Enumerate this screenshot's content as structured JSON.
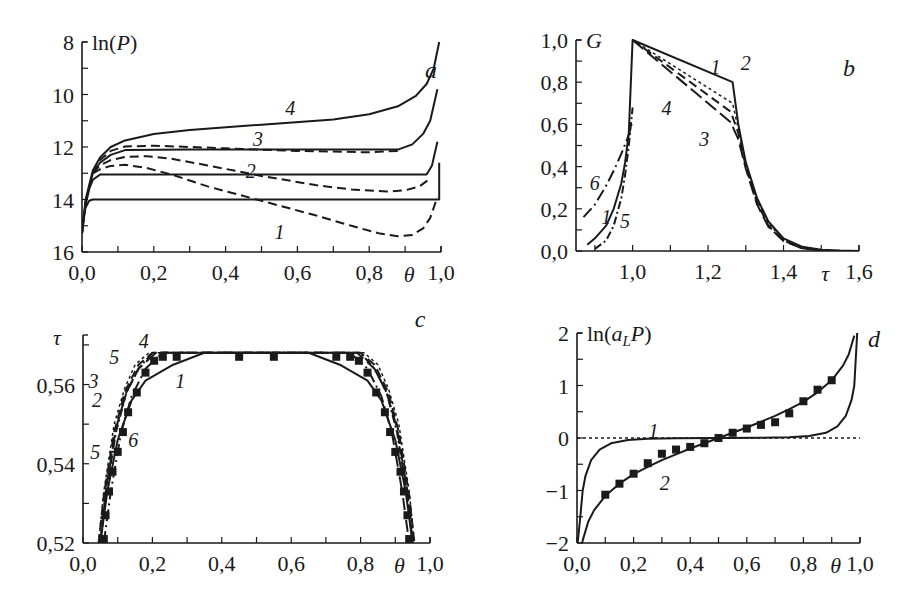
{
  "figure": {
    "panels": [
      "a",
      "b",
      "c",
      "d"
    ]
  },
  "chart_data": [
    {
      "id": "a",
      "type": "line",
      "panel_letter": "a",
      "ylabel": "ln(P)",
      "xlabel": "θ",
      "xlim": [
        0.0,
        1.0
      ],
      "ylim": [
        16,
        8
      ],
      "y_inverted": true,
      "xticks": [
        "0,0",
        "0,2",
        "0,4",
        "0,6",
        "0,8",
        "1,0"
      ],
      "xtick_values": [
        0.0,
        0.2,
        0.4,
        0.6,
        0.8,
        1.0
      ],
      "yticks": [
        "8",
        "10",
        "12",
        "14",
        "16"
      ],
      "ytick_values": [
        8,
        10,
        12,
        14,
        16
      ],
      "frame": {
        "x0": 82,
        "x1": 441,
        "y0": 42,
        "y1": 252
      },
      "series": [
        {
          "name": "flat-14",
          "style": "solid",
          "x": [
            0.0,
            0.005,
            0.01,
            0.02,
            0.03,
            0.99,
            0.995,
            0.995
          ],
          "y": [
            15.3,
            14.6,
            14.3,
            14.05,
            14.0,
            14.0,
            14.0,
            12.6
          ]
        },
        {
          "name": "flat-13",
          "style": "solid",
          "x": [
            0.0,
            0.01,
            0.02,
            0.03,
            0.05,
            0.96,
            0.975,
            0.99
          ],
          "y": [
            15.3,
            14.2,
            13.6,
            13.25,
            13.05,
            13.05,
            12.7,
            11.8
          ]
        },
        {
          "name": "3",
          "style": "solid",
          "x": [
            0.0,
            0.01,
            0.03,
            0.05,
            0.08,
            0.12,
            0.3,
            0.6,
            0.88,
            0.92,
            0.95,
            0.97,
            0.99
          ],
          "y": [
            15.3,
            14.1,
            13.0,
            12.6,
            12.3,
            12.12,
            12.1,
            12.1,
            12.1,
            11.9,
            11.5,
            11.0,
            9.8
          ]
        },
        {
          "name": "4",
          "style": "solid",
          "x": [
            0.0,
            0.01,
            0.03,
            0.05,
            0.08,
            0.12,
            0.2,
            0.3,
            0.5,
            0.7,
            0.8,
            0.88,
            0.93,
            0.96,
            0.98,
            0.995
          ],
          "y": [
            15.3,
            14.0,
            12.9,
            12.4,
            12.0,
            11.75,
            11.5,
            11.35,
            11.15,
            10.95,
            10.75,
            10.45,
            10.05,
            9.6,
            9.0,
            8.0
          ]
        },
        {
          "name": "3-dashed",
          "style": "dashed",
          "x": [
            0.03,
            0.05,
            0.08,
            0.12,
            0.2,
            0.4,
            0.6,
            0.8,
            0.88
          ],
          "y": [
            13.0,
            12.5,
            12.15,
            11.98,
            11.95,
            12.05,
            12.15,
            12.2,
            12.15
          ]
        },
        {
          "name": "2",
          "style": "dashed",
          "x": [
            0.03,
            0.05,
            0.08,
            0.12,
            0.18,
            0.25,
            0.35,
            0.5,
            0.65,
            0.75,
            0.85,
            0.9,
            0.94,
            0.97
          ],
          "y": [
            13.0,
            12.7,
            12.5,
            12.38,
            12.35,
            12.45,
            12.7,
            13.1,
            13.45,
            13.62,
            13.7,
            13.65,
            13.5,
            13.2
          ]
        },
        {
          "name": "1",
          "style": "dashed",
          "x": [
            0.03,
            0.05,
            0.08,
            0.12,
            0.18,
            0.25,
            0.35,
            0.5,
            0.65,
            0.75,
            0.83,
            0.88,
            0.92,
            0.95,
            0.97,
            0.99
          ],
          "y": [
            13.0,
            12.85,
            12.72,
            12.68,
            12.8,
            13.05,
            13.5,
            14.05,
            14.6,
            15.0,
            15.3,
            15.4,
            15.35,
            15.1,
            14.7,
            13.9
          ]
        }
      ],
      "annotations": [
        {
          "text": "4",
          "x": 0.58,
          "y": 10.5
        },
        {
          "text": "3",
          "x": 0.49,
          "y": 11.7
        },
        {
          "text": "2",
          "x": 0.47,
          "y": 12.9
        },
        {
          "text": "1",
          "x": 0.55,
          "y": 15.25
        }
      ]
    },
    {
      "id": "b",
      "type": "line",
      "panel_letter": "b",
      "ylabel": "G",
      "xlabel": "τ",
      "xlim": [
        0.85,
        1.6
      ],
      "ylim": [
        0.0,
        1.0
      ],
      "xticks": [
        "1,0",
        "1,2",
        "1,4",
        "1,6"
      ],
      "xtick_values": [
        1.0,
        1.2,
        1.4,
        1.6
      ],
      "yticks": [
        "0,0",
        "0,2",
        "0,4",
        "0,6",
        "0,8",
        "1,0"
      ],
      "ytick_values": [
        0.0,
        0.2,
        0.4,
        0.6,
        0.8,
        1.0
      ],
      "frame": {
        "x0": 576,
        "x1": 859,
        "y0": 40,
        "y1": 251
      },
      "series": [
        {
          "name": "1",
          "style": "solid",
          "x": [
            0.88,
            0.9,
            0.93,
            0.95,
            0.97,
            0.98,
            0.99,
            1.0,
            1.265,
            1.28,
            1.3,
            1.33,
            1.36,
            1.4,
            1.45,
            1.5,
            1.55,
            1.6
          ],
          "y": [
            0.03,
            0.06,
            0.12,
            0.2,
            0.32,
            0.42,
            0.56,
            1.0,
            0.8,
            0.6,
            0.42,
            0.25,
            0.14,
            0.06,
            0.02,
            0.006,
            0.002,
            0.0
          ]
        },
        {
          "name": "2",
          "style": "dotted",
          "x": [
            1.0,
            1.265,
            1.28,
            1.3,
            1.33,
            1.36,
            1.4,
            1.45,
            1.5
          ],
          "y": [
            1.0,
            0.7,
            0.58,
            0.41,
            0.24,
            0.13,
            0.055,
            0.015,
            0.004
          ]
        },
        {
          "name": "3",
          "style": "dashed",
          "x": [
            1.0,
            1.26,
            1.28,
            1.3,
            1.33,
            1.36,
            1.4,
            1.45,
            1.5
          ],
          "y": [
            1.0,
            0.66,
            0.56,
            0.4,
            0.23,
            0.12,
            0.05,
            0.013,
            0.003
          ]
        },
        {
          "name": "4",
          "style": "longdash",
          "x": [
            1.0,
            1.26,
            1.28,
            1.3,
            1.33,
            1.36,
            1.4,
            1.45,
            1.5
          ],
          "y": [
            1.0,
            0.61,
            0.53,
            0.39,
            0.22,
            0.115,
            0.048,
            0.012,
            0.003
          ]
        },
        {
          "name": "5",
          "style": "dashdot",
          "x": [
            0.9,
            0.93,
            0.95,
            0.97,
            0.98,
            0.99,
            1.0
          ],
          "y": [
            0.01,
            0.05,
            0.12,
            0.25,
            0.36,
            0.5,
            0.68
          ]
        },
        {
          "name": "6",
          "style": "dashdot-long",
          "x": [
            0.87,
            0.9,
            0.93,
            0.95,
            0.97,
            0.99,
            1.0
          ],
          "y": [
            0.16,
            0.22,
            0.31,
            0.38,
            0.46,
            0.55,
            0.62
          ]
        }
      ],
      "annotations": [
        {
          "text": "1",
          "x": 1.22,
          "y": 0.87
        },
        {
          "text": "2",
          "x": 1.3,
          "y": 0.89
        },
        {
          "text": "3",
          "x": 1.19,
          "y": 0.53
        },
        {
          "text": "4",
          "x": 1.09,
          "y": 0.68
        },
        {
          "text": "5",
          "x": 0.98,
          "y": 0.14
        },
        {
          "text": "6",
          "x": 0.9,
          "y": 0.32
        },
        {
          "text": "1",
          "x": 0.93,
          "y": 0.16
        }
      ]
    },
    {
      "id": "c",
      "type": "line",
      "panel_letter": "c",
      "ylabel": "τ",
      "xlabel": "θ",
      "xlim": [
        0.0,
        1.0
      ],
      "ylim": [
        0.52,
        0.5725
      ],
      "xticks": [
        "0,0",
        "0,2",
        "0,4",
        "0,6",
        "0,8",
        "1,0"
      ],
      "xtick_values": [
        0.0,
        0.2,
        0.4,
        0.6,
        0.8,
        1.0
      ],
      "yticks": [
        "0,52",
        "0,54",
        "0,56"
      ],
      "ytick_values": [
        0.52,
        0.54,
        0.56
      ],
      "frame": {
        "x0": 83,
        "x1": 430,
        "y0": 335,
        "y1": 543
      },
      "series": [
        {
          "name": "1",
          "style": "solid",
          "x": [
            0.05,
            0.07,
            0.1,
            0.14,
            0.18,
            0.26,
            0.35,
            0.65,
            0.74,
            0.82,
            0.86,
            0.9,
            0.93,
            0.95
          ],
          "y": [
            0.52,
            0.533,
            0.546,
            0.556,
            0.561,
            0.565,
            0.568,
            0.568,
            0.565,
            0.561,
            0.556,
            0.546,
            0.533,
            0.52
          ]
        },
        {
          "name": "2",
          "style": "dashed",
          "x": [
            0.045,
            0.06,
            0.09,
            0.12,
            0.16,
            0.2,
            0.8,
            0.84,
            0.88,
            0.91,
            0.94,
            0.955
          ],
          "y": [
            0.52,
            0.532,
            0.548,
            0.558,
            0.565,
            0.568,
            0.568,
            0.565,
            0.558,
            0.548,
            0.532,
            0.52
          ]
        },
        {
          "name": "3",
          "style": "dotted",
          "x": [
            0.045,
            0.06,
            0.09,
            0.12,
            0.15,
            0.19,
            0.81,
            0.85,
            0.88,
            0.91,
            0.94,
            0.955
          ],
          "y": [
            0.52,
            0.533,
            0.55,
            0.559,
            0.565,
            0.568,
            0.568,
            0.565,
            0.559,
            0.55,
            0.533,
            0.52
          ]
        },
        {
          "name": "4",
          "style": "longdash",
          "x": [
            0.05,
            0.065,
            0.095,
            0.125,
            0.16,
            0.21,
            0.79,
            0.84,
            0.875,
            0.905,
            0.935,
            0.95
          ],
          "y": [
            0.52,
            0.533,
            0.549,
            0.558,
            0.564,
            0.568,
            0.568,
            0.564,
            0.558,
            0.549,
            0.533,
            0.52
          ]
        },
        {
          "name": "5",
          "style": "dashdot",
          "x": [
            0.05,
            0.065,
            0.095,
            0.125,
            0.16,
            0.2,
            0.8,
            0.84,
            0.875,
            0.905,
            0.935,
            0.95
          ],
          "y": [
            0.52,
            0.532,
            0.548,
            0.558,
            0.564,
            0.568,
            0.568,
            0.564,
            0.558,
            0.548,
            0.532,
            0.52
          ]
        },
        {
          "name": "6",
          "style": "dashdot-long",
          "x": [
            0.06,
            0.08,
            0.11,
            0.14,
            0.18,
            0.23,
            0.77,
            0.82,
            0.86,
            0.89,
            0.92,
            0.94
          ],
          "y": [
            0.52,
            0.533,
            0.548,
            0.557,
            0.564,
            0.568,
            0.568,
            0.564,
            0.557,
            0.548,
            0.533,
            0.52
          ]
        }
      ],
      "markers": {
        "shape": "square",
        "x": [
          0.06,
          0.065,
          0.075,
          0.085,
          0.1,
          0.115,
          0.13,
          0.155,
          0.18,
          0.205,
          0.23,
          0.27,
          0.45,
          0.55,
          0.73,
          0.77,
          0.795,
          0.82,
          0.845,
          0.87,
          0.885,
          0.9,
          0.915,
          0.925,
          0.935,
          0.94
        ],
        "y": [
          0.521,
          0.527,
          0.533,
          0.538,
          0.543,
          0.548,
          0.553,
          0.558,
          0.563,
          0.566,
          0.567,
          0.567,
          0.567,
          0.567,
          0.567,
          0.567,
          0.566,
          0.563,
          0.558,
          0.553,
          0.548,
          0.543,
          0.538,
          0.533,
          0.527,
          0.521
        ]
      },
      "annotations": [
        {
          "text": "4",
          "x": 0.175,
          "y": 0.571
        },
        {
          "text": "5",
          "x": 0.09,
          "y": 0.567
        },
        {
          "text": "3",
          "x": 0.03,
          "y": 0.561
        },
        {
          "text": "2",
          "x": 0.04,
          "y": 0.556
        },
        {
          "text": "5",
          "x": 0.035,
          "y": 0.543
        },
        {
          "text": "6",
          "x": 0.145,
          "y": 0.546
        },
        {
          "text": "1",
          "x": 0.28,
          "y": 0.561
        }
      ]
    },
    {
      "id": "d",
      "type": "line",
      "panel_letter": "d",
      "ylabel": "ln(a_L P)",
      "xlabel": "θ",
      "xlim": [
        0.0,
        1.0
      ],
      "ylim": [
        -2,
        2
      ],
      "xticks": [
        "0,0",
        "0,2",
        "0,4",
        "0,6",
        "0,8",
        "1,0"
      ],
      "xtick_values": [
        0.0,
        0.2,
        0.4,
        0.6,
        0.8,
        1.0
      ],
      "yticks": [
        "−2",
        "−1",
        "0",
        "1",
        "2"
      ],
      "ytick_values": [
        -2,
        -1,
        0,
        1,
        2
      ],
      "frame": {
        "x0": 577,
        "x1": 860,
        "y0": 333,
        "y1": 543
      },
      "series": [
        {
          "name": "zero-line",
          "style": "dotted",
          "x": [
            0.0,
            1.0
          ],
          "y": [
            0,
            0
          ]
        },
        {
          "name": "1",
          "style": "solid",
          "x": [
            0.002,
            0.01,
            0.02,
            0.03,
            0.05,
            0.08,
            0.12,
            0.18,
            0.25,
            0.35,
            0.5,
            0.65,
            0.75,
            0.82,
            0.88,
            0.92,
            0.95,
            0.97,
            0.98,
            0.99
          ],
          "y": [
            -2.0,
            -1.6,
            -1.0,
            -0.72,
            -0.42,
            -0.22,
            -0.1,
            -0.04,
            -0.015,
            -0.003,
            0.0,
            0.003,
            0.015,
            0.04,
            0.1,
            0.22,
            0.42,
            0.72,
            1.0,
            2.0
          ]
        },
        {
          "name": "2",
          "style": "solid",
          "x": [
            0.01,
            0.02,
            0.04,
            0.06,
            0.1,
            0.15,
            0.2,
            0.25,
            0.3,
            0.35,
            0.4,
            0.45,
            0.5,
            0.55,
            0.6,
            0.65,
            0.7,
            0.75,
            0.8,
            0.85,
            0.9,
            0.94,
            0.96,
            0.98
          ],
          "y": [
            -2.3,
            -1.95,
            -1.59,
            -1.38,
            -1.1,
            -0.87,
            -0.69,
            -0.55,
            -0.42,
            -0.31,
            -0.2,
            -0.1,
            0.0,
            0.1,
            0.2,
            0.31,
            0.42,
            0.55,
            0.69,
            0.87,
            1.1,
            1.38,
            1.59,
            1.95
          ]
        }
      ],
      "markers": {
        "shape": "square",
        "series": "2",
        "x": [
          0.1,
          0.15,
          0.2,
          0.25,
          0.3,
          0.35,
          0.4,
          0.45,
          0.5,
          0.55,
          0.6,
          0.65,
          0.7,
          0.75,
          0.8,
          0.85,
          0.9
        ],
        "y": [
          -1.08,
          -0.87,
          -0.68,
          -0.48,
          -0.3,
          -0.22,
          -0.17,
          -0.1,
          0.0,
          0.1,
          0.18,
          0.25,
          0.3,
          0.47,
          0.7,
          0.92,
          1.1
        ]
      },
      "annotations": [
        {
          "text": "1",
          "x": 0.27,
          "y": 0.13
        },
        {
          "text": "2",
          "x": 0.31,
          "y": -0.85
        }
      ]
    }
  ]
}
